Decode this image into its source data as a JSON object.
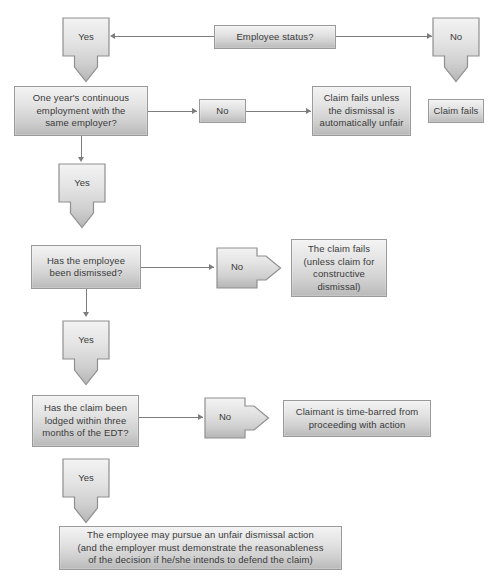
{
  "diagram": {
    "background_color": "#ffffff",
    "node_fill_light": "#f3f3f3",
    "node_fill_dark": "#b9b9b9",
    "node_border_color": "#9a9a9a",
    "connector_color": "#7d7d7d",
    "text_color": "#3a3a3a"
  },
  "nodes": {
    "employee_status": "Employee status?",
    "yes_1": "Yes",
    "no_1": "No",
    "claim_fails_short": "Claim fails",
    "one_year": "One year's continuous employment with the same employer?",
    "one_year_l1": "One year's continuous",
    "one_year_l2": "employment with the",
    "one_year_l3": "same employer?",
    "no_2": "No",
    "claim_fails_unless_l1": "Claim fails unless",
    "claim_fails_unless_l2": "the dismissal is",
    "claim_fails_unless_l3": "automatically unfair",
    "yes_2": "Yes",
    "dismissed_l1": "Has the employee",
    "dismissed_l2": "been dismissed?",
    "no_3": "No",
    "claim_fails_constructive_l1": "The claim fails",
    "claim_fails_constructive_l2": "(unless claim for",
    "claim_fails_constructive_l3": "constructive",
    "claim_fails_constructive_l4": "dismissal)",
    "yes_3": "Yes",
    "lodged_l1": "Has the claim been",
    "lodged_l2": "lodged within three",
    "lodged_l3": "months of the EDT?",
    "no_4": "No",
    "time_barred_l1": "Claimant is time-barred from",
    "time_barred_l2": "proceeding with action",
    "yes_4": "Yes",
    "outcome_l1": "The employee may pursue an unfair dismissal action",
    "outcome_l2": "(and the employer must demonstrate the reasonableness",
    "outcome_l3": "of the decision if he/she intends to defend the claim)"
  },
  "caption": {
    "text": ""
  }
}
